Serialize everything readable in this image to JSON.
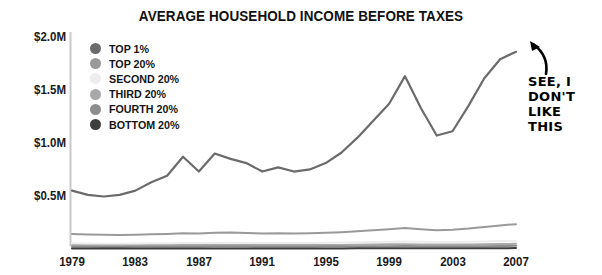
{
  "chart_data": {
    "type": "line",
    "title": "AVERAGE HOUSEHOLD INCOME BEFORE TAXES",
    "xlabel": "",
    "ylabel": "",
    "xlim": [
      1979,
      2007
    ],
    "ylim": [
      0,
      2000000
    ],
    "grid": false,
    "legend_position": "top-left",
    "y_ticks": [
      {
        "value": 2000000,
        "label": "$2.0M"
      },
      {
        "value": 1500000,
        "label": "$1.5M"
      },
      {
        "value": 1000000,
        "label": "$1.0M"
      },
      {
        "value": 500000,
        "label": "$0.5M"
      }
    ],
    "x_ticks": [
      {
        "value": 1979,
        "label": "1979"
      },
      {
        "value": 1983,
        "label": "1983"
      },
      {
        "value": 1987,
        "label": "1987"
      },
      {
        "value": 1991,
        "label": "1991"
      },
      {
        "value": 1995,
        "label": "1995"
      },
      {
        "value": 1999,
        "label": "1999"
      },
      {
        "value": 2003,
        "label": "2003"
      },
      {
        "value": 2007,
        "label": "2007"
      }
    ],
    "x": [
      1979,
      1980,
      1981,
      1982,
      1983,
      1984,
      1985,
      1986,
      1987,
      1988,
      1989,
      1990,
      1991,
      1992,
      1993,
      1994,
      1995,
      1996,
      1997,
      1998,
      1999,
      2000,
      2001,
      2002,
      2003,
      2004,
      2005,
      2006,
      2007
    ],
    "series": [
      {
        "name": "TOP 1%",
        "color": "#6b6b6b",
        "values": [
          560000,
          520000,
          505000,
          520000,
          560000,
          640000,
          700000,
          880000,
          740000,
          910000,
          860000,
          820000,
          740000,
          780000,
          740000,
          760000,
          820000,
          920000,
          1060000,
          1220000,
          1380000,
          1640000,
          1340000,
          1080000,
          1120000,
          1360000,
          1620000,
          1800000,
          1870000
        ]
      },
      {
        "name": "TOP 20%",
        "color": "#9a9a9a",
        "values": [
          150000,
          146000,
          143000,
          142000,
          144000,
          148000,
          152000,
          158000,
          156000,
          162000,
          164000,
          160000,
          156000,
          158000,
          156000,
          158000,
          163000,
          168000,
          176000,
          186000,
          196000,
          208000,
          196000,
          186000,
          190000,
          202000,
          218000,
          232000,
          244000
        ]
      },
      {
        "name": "SECOND 20%",
        "color": "#ededed",
        "values": [
          62000,
          61000,
          60000,
          60000,
          61000,
          63000,
          64000,
          65000,
          65000,
          67000,
          68000,
          67000,
          65000,
          66000,
          65000,
          66000,
          68000,
          70000,
          72000,
          75000,
          78000,
          80000,
          77000,
          75000,
          76000,
          78000,
          81000,
          84000,
          86000
        ]
      },
      {
        "name": "THIRD 20%",
        "color": "#a8a8a8",
        "values": [
          44000,
          43000,
          42000,
          42000,
          43000,
          44000,
          45000,
          46000,
          46000,
          47000,
          48000,
          47000,
          46000,
          46000,
          46000,
          46000,
          47000,
          48000,
          50000,
          52000,
          54000,
          55000,
          53000,
          52000,
          52000,
          53000,
          55000,
          57000,
          58000
        ]
      },
      {
        "name": "FOURTH 20%",
        "color": "#8d8d8d",
        "values": [
          30000,
          29500,
          29000,
          29000,
          29500,
          30000,
          30500,
          31000,
          31000,
          32000,
          32500,
          32000,
          31000,
          31000,
          31000,
          31000,
          32000,
          32500,
          33500,
          35000,
          36000,
          37000,
          35500,
          35000,
          35000,
          35500,
          36500,
          38000,
          39000
        ]
      },
      {
        "name": "BOTTOM 20%",
        "color": "#3d3d3d",
        "values": [
          14000,
          13700,
          13400,
          13300,
          13400,
          13700,
          14000,
          14200,
          14200,
          14600,
          14900,
          14700,
          14300,
          14300,
          14200,
          14300,
          14600,
          14900,
          15400,
          16000,
          16600,
          17000,
          16400,
          16000,
          16000,
          16200,
          16700,
          17300,
          17800
        ]
      }
    ]
  },
  "legend": {
    "items": [
      {
        "label": "TOP 1%",
        "color": "#6b6b6b"
      },
      {
        "label": "TOP 20%",
        "color": "#9a9a9a"
      },
      {
        "label": "SECOND 20%",
        "color": "#ededed"
      },
      {
        "label": "THIRD 20%",
        "color": "#a8a8a8"
      },
      {
        "label": "FOURTH 20%",
        "color": "#8d8d8d"
      },
      {
        "label": "BOTTOM 20%",
        "color": "#3d3d3d"
      }
    ]
  },
  "annotation": {
    "line1": "SEE, I",
    "line2": "DON'T",
    "line3": "LIKE",
    "line4": "THIS"
  },
  "axis": {
    "color": "#c9c9c9"
  }
}
